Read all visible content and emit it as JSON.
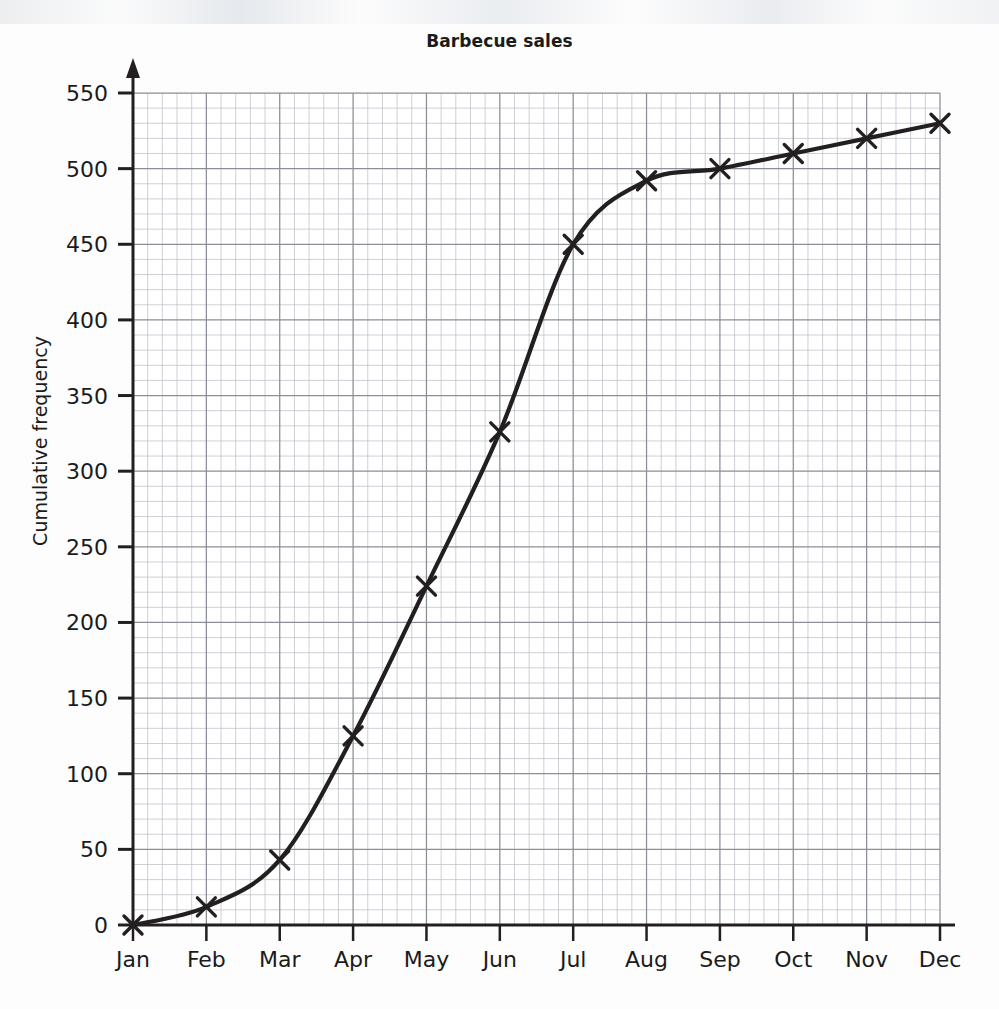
{
  "chart_data": {
    "type": "line",
    "title": "Barbecue sales",
    "xlabel": "",
    "ylabel": "Cumulative frequency",
    "categories": [
      "Jan",
      "Feb",
      "Mar",
      "Apr",
      "May",
      "Jun",
      "Jul",
      "Aug",
      "Sep",
      "Oct",
      "Nov",
      "Dec"
    ],
    "values": [
      0,
      12,
      43,
      125,
      224,
      326,
      450,
      492,
      500,
      510,
      520,
      530
    ],
    "series": [
      {
        "name": "Cumulative frequency",
        "values": [
          0,
          12,
          43,
          125,
          224,
          326,
          450,
          492,
          500,
          510,
          520,
          530
        ]
      }
    ],
    "ylim": [
      0,
      550
    ],
    "ytick_values": [
      0,
      50,
      100,
      150,
      200,
      250,
      300,
      350,
      400,
      450,
      500,
      550
    ],
    "ytick_labels": [
      "0",
      "50",
      "100",
      "150",
      "200",
      "250",
      "300",
      "350",
      "400",
      "450",
      "500",
      "550"
    ],
    "xtick_labels": [
      "Jan",
      "Feb",
      "Mar",
      "Apr",
      "May",
      "Jun",
      "Jul",
      "Aug",
      "Sep",
      "Oct",
      "Nov",
      "Dec"
    ],
    "grid": true,
    "grid_minor": true,
    "minor_divisions_per_major": 5,
    "legend": null,
    "marker": "x",
    "line_color": "#231f20",
    "grid_major_color": "#8b8e96",
    "grid_minor_color": "#b9bcc4",
    "axis_color": "#231f20",
    "arrow_on_y_axis": true
  }
}
